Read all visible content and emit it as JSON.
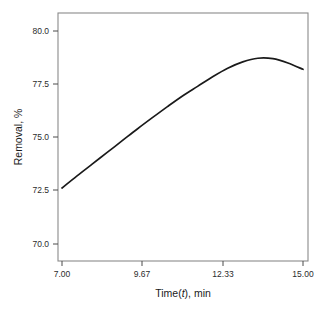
{
  "chart_data": {
    "type": "line",
    "title": "",
    "subtitle": "",
    "xlabel_parts": {
      "prefix": "Time(",
      "italic": "t",
      "suffix": "), min"
    },
    "xlabel": "Time(t), min",
    "ylabel": "Removal, %",
    "xlim": [
      7.0,
      15.0
    ],
    "ylim": [
      69.2,
      80.7
    ],
    "xticks": [
      7.0,
      9.67,
      12.33,
      15.0
    ],
    "xtick_labels": [
      "7.00",
      "9.67",
      "12.33",
      "15.00"
    ],
    "yticks": [
      70.0,
      72.5,
      75.0,
      77.5,
      80.0
    ],
    "ytick_labels": [
      "70.0",
      "72.5",
      "75.0",
      "77.5",
      "80.0"
    ],
    "grid": false,
    "legend": false,
    "legend_position": "none",
    "series": [
      {
        "name": "Removal",
        "color": "#1a1a1a",
        "x": [
          7.0,
          7.5,
          8.0,
          8.5,
          9.0,
          9.5,
          10.0,
          10.5,
          11.0,
          11.5,
          12.0,
          12.5,
          13.0,
          13.5,
          14.0,
          14.5,
          15.0
        ],
        "y": [
          72.63,
          73.2,
          73.75,
          74.3,
          74.85,
          75.4,
          75.93,
          76.45,
          76.95,
          77.4,
          77.85,
          78.25,
          78.55,
          78.72,
          78.7,
          78.5,
          78.2
        ]
      }
    ],
    "curve_peak": {
      "x": 13.55,
      "y": 78.72
    },
    "curve_start": {
      "x": 7.0,
      "y": 72.63
    },
    "curve_end": {
      "x": 15.0,
      "y": 78.2
    }
  },
  "plot_geometry": {
    "frame_left": 58,
    "frame_right": 308,
    "frame_top": 13,
    "frame_bottom": 261,
    "x_pix_min": 62,
    "x_pix_max": 303,
    "y_pix_at_70": 244,
    "y_pix_at_80": 31
  },
  "colors": {
    "background": "#ffffff",
    "frame": "#8a8a8a",
    "curve": "#1a1a1a",
    "tick_text": "#2b2b2b",
    "axis_title": "#1a1a1a"
  }
}
